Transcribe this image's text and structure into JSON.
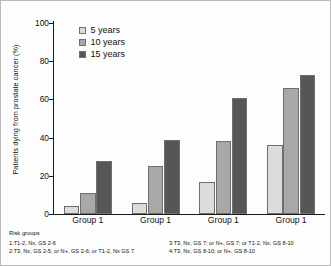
{
  "chart_data": {
    "type": "bar",
    "title": "",
    "xlabel": "",
    "ylabel": "Patients dying from prostate cancer (%)",
    "ylim": [
      0,
      100
    ],
    "yticks": [
      0,
      20,
      40,
      60,
      80,
      100
    ],
    "grid": false,
    "legend_position": "top-left",
    "categories": [
      "Group 1",
      "Group 1",
      "Group 1",
      "Group 1"
    ],
    "series": [
      {
        "name": "5 years",
        "color": "#dcdcdc",
        "values": [
          4,
          6,
          17,
          36
        ]
      },
      {
        "name": "10 years",
        "color": "#a8a8a8",
        "values": [
          11,
          25,
          38,
          66
        ]
      },
      {
        "name": "15 years",
        "color": "#565656",
        "values": [
          28,
          39,
          61,
          73
        ]
      }
    ]
  },
  "legend": {
    "items": [
      {
        "label": "5 years"
      },
      {
        "label": "10 years"
      },
      {
        "label": "15 years"
      }
    ]
  },
  "footnote": {
    "title": "Risk groups",
    "left_lines": [
      "1:T1-2, Nx, GS 2-6",
      "2:T3, Nx, GS 2-5; or N+, GS 2-6; or T1-2, Nx GS 7"
    ],
    "right_lines": [
      "3:T3, Nx, GS 7; or N+, GS 7; or T1-2, Nx, GS 8-10",
      "4:T3, Nx, GS 8-10; or N+, GS 8-10"
    ]
  },
  "axis": {
    "tick_labels": [
      "100",
      "80",
      "60",
      "40",
      "20",
      "0"
    ]
  }
}
